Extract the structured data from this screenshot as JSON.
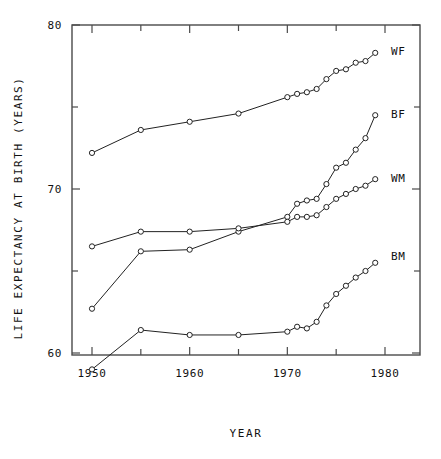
{
  "chart_data": {
    "type": "line",
    "title": "",
    "xlabel": "YEAR",
    "ylabel": "LIFE EXPECTANCY AT BIRTH (YEARS)",
    "xlim": [
      1948,
      1981
    ],
    "ylim": [
      57,
      80
    ],
    "grid": false,
    "legend_position": "right-inline",
    "x_major_ticks": [
      1950,
      1960,
      1970,
      1980
    ],
    "x_major_tick_labels": [
      "1950",
      "1960",
      "1970",
      "1980"
    ],
    "x_minor_ticks": [
      1955,
      1965,
      1975
    ],
    "y_major_ticks": [
      60,
      70,
      80
    ],
    "y_major_tick_labels": [
      "60",
      "70",
      "80"
    ],
    "y_minor_ticks": [
      65,
      75
    ],
    "x": [
      1950,
      1955,
      1960,
      1965,
      1970,
      1971,
      1972,
      1973,
      1974,
      1975,
      1976,
      1977,
      1978,
      1979
    ],
    "series": [
      {
        "name": "WF",
        "label": "WF",
        "color": "#222222",
        "values": [
          72.2,
          73.6,
          74.1,
          74.6,
          75.6,
          75.8,
          75.9,
          76.1,
          76.7,
          77.2,
          77.3,
          77.7,
          77.8,
          78.3
        ]
      },
      {
        "name": "BF",
        "label": "BF",
        "color": "#222222",
        "values": [
          62.7,
          66.2,
          66.3,
          67.4,
          68.3,
          69.1,
          69.3,
          69.4,
          70.3,
          71.3,
          71.6,
          72.4,
          73.1,
          74.5
        ]
      },
      {
        "name": "WM",
        "label": "WM",
        "color": "#222222",
        "values": [
          66.5,
          67.4,
          67.4,
          67.6,
          68.0,
          68.3,
          68.3,
          68.4,
          68.9,
          69.4,
          69.7,
          70.0,
          70.2,
          70.6
        ]
      },
      {
        "name": "BM",
        "label": "BM",
        "color": "#222222",
        "values": [
          59.0,
          61.4,
          61.1,
          61.1,
          61.3,
          61.6,
          61.5,
          61.9,
          62.9,
          63.6,
          64.1,
          64.6,
          65.0,
          65.5
        ]
      }
    ],
    "series_label_positions": [
      {
        "name": "WF",
        "x": 1981.2,
        "y": 78.4
      },
      {
        "name": "BF",
        "x": 1981.2,
        "y": 74.6
      },
      {
        "name": "WM",
        "x": 1981.2,
        "y": 70.7
      },
      {
        "name": "BM",
        "x": 1981.2,
        "y": 65.9
      }
    ]
  }
}
